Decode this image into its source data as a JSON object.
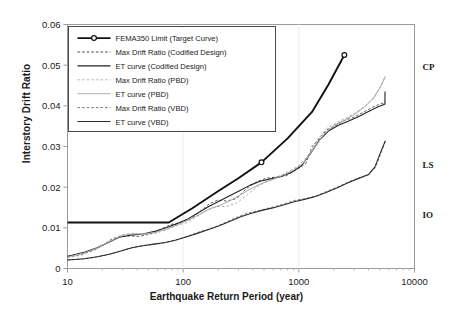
{
  "chart_data": {
    "type": "line",
    "title": "",
    "xlabel": "Earthquake Return Period (year)",
    "ylabel": "Interstory Drift Ratio",
    "xscale": "log",
    "xlim": [
      10,
      10000
    ],
    "ylim": [
      0,
      0.06
    ],
    "xticks": [
      10,
      100,
      1000,
      10000
    ],
    "xtick_labels": [
      "10",
      "100",
      "1000",
      "10000"
    ],
    "yticks": [
      0,
      0.01,
      0.02,
      0.03,
      0.04,
      0.05,
      0.06
    ],
    "ytick_labels": [
      "0",
      "0.01",
      "0.02",
      "0.03",
      "0.04",
      "0.05",
      "0.06"
    ],
    "grid": false,
    "legend_position": "upper left",
    "annotations": [
      {
        "label": "CP",
        "value": 0.0495,
        "note": "Collapse Prevention performance level"
      },
      {
        "label": "LS",
        "value": 0.0255,
        "note": "Life Safety performance level"
      },
      {
        "label": "IO",
        "value": 0.0133,
        "note": "Immediate Occupancy performance level"
      }
    ],
    "series": [
      {
        "name": "FEMA350 Limit (Target Curve)",
        "style": "solid",
        "color": "#111111",
        "width": 1.9,
        "marker": "circle-open",
        "markers_at": [
          [
            475,
            0.0261
          ],
          [
            2475,
            0.0525
          ]
        ],
        "points": [
          [
            10,
            0.0113
          ],
          [
            30,
            0.0113
          ],
          [
            50,
            0.0113
          ],
          [
            75,
            0.0113
          ],
          [
            120,
            0.0148
          ],
          [
            200,
            0.019
          ],
          [
            300,
            0.0222
          ],
          [
            475,
            0.0261
          ],
          [
            800,
            0.032
          ],
          [
            1300,
            0.0385
          ],
          [
            1800,
            0.0452
          ],
          [
            2475,
            0.0525
          ]
        ]
      },
      {
        "name": "Max Drift Ratio (Codified Design)",
        "style": "dashed",
        "color": "#333333",
        "width": 0.8,
        "points": [
          [
            10,
            0.0029
          ],
          [
            13,
            0.0034
          ],
          [
            17,
            0.0045
          ],
          [
            20,
            0.0056
          ],
          [
            24,
            0.0072
          ],
          [
            28,
            0.0078
          ],
          [
            34,
            0.008
          ],
          [
            42,
            0.0079
          ],
          [
            52,
            0.0085
          ],
          [
            64,
            0.0096
          ],
          [
            78,
            0.0108
          ],
          [
            95,
            0.0113
          ],
          [
            115,
            0.0122
          ],
          [
            140,
            0.014
          ],
          [
            170,
            0.016
          ],
          [
            200,
            0.0168
          ],
          [
            240,
            0.0166
          ],
          [
            290,
            0.0172
          ],
          [
            350,
            0.0196
          ],
          [
            430,
            0.0213
          ],
          [
            520,
            0.0222
          ],
          [
            640,
            0.0225
          ],
          [
            780,
            0.0228
          ],
          [
            950,
            0.0243
          ],
          [
            1150,
            0.0258
          ],
          [
            1300,
            0.03
          ],
          [
            1500,
            0.032
          ],
          [
            1750,
            0.0341
          ],
          [
            2100,
            0.0352
          ],
          [
            2500,
            0.0364
          ],
          [
            3000,
            0.0372
          ],
          [
            3600,
            0.0384
          ],
          [
            4300,
            0.0396
          ],
          [
            5200,
            0.0406
          ],
          [
            5600,
            0.0406
          ]
        ]
      },
      {
        "name": "ET curve (Codified Design)",
        "style": "solid",
        "color": "#222222",
        "width": 1.1,
        "points": [
          [
            10,
            0.003
          ],
          [
            14,
            0.004
          ],
          [
            18,
            0.0051
          ],
          [
            23,
            0.0065
          ],
          [
            28,
            0.0077
          ],
          [
            35,
            0.0082
          ],
          [
            45,
            0.0085
          ],
          [
            58,
            0.0092
          ],
          [
            72,
            0.0101
          ],
          [
            90,
            0.0111
          ],
          [
            110,
            0.0122
          ],
          [
            135,
            0.0137
          ],
          [
            165,
            0.0152
          ],
          [
            200,
            0.0164
          ],
          [
            250,
            0.0178
          ],
          [
            310,
            0.0192
          ],
          [
            380,
            0.0205
          ],
          [
            470,
            0.0215
          ],
          [
            580,
            0.0221
          ],
          [
            700,
            0.0226
          ],
          [
            860,
            0.0236
          ],
          [
            1050,
            0.0252
          ],
          [
            1250,
            0.0281
          ],
          [
            1500,
            0.0315
          ],
          [
            1800,
            0.0338
          ],
          [
            2200,
            0.0352
          ],
          [
            2700,
            0.0363
          ],
          [
            3300,
            0.0374
          ],
          [
            4000,
            0.0386
          ],
          [
            4800,
            0.0397
          ],
          [
            5500,
            0.0404
          ],
          [
            5550,
            0.0404
          ],
          [
            5560,
            0.0435
          ]
        ]
      },
      {
        "name": "Max Drift Ratio (PBD)",
        "style": "dashed",
        "color": "#9a9a9a",
        "width": 0.8,
        "points": [
          [
            10,
            0.0027
          ],
          [
            13,
            0.0032
          ],
          [
            16,
            0.0043
          ],
          [
            20,
            0.0057
          ],
          [
            25,
            0.0074
          ],
          [
            30,
            0.0083
          ],
          [
            37,
            0.0086
          ],
          [
            46,
            0.0083
          ],
          [
            57,
            0.0086
          ],
          [
            70,
            0.0094
          ],
          [
            86,
            0.0105
          ],
          [
            105,
            0.0112
          ],
          [
            130,
            0.0127
          ],
          [
            160,
            0.0143
          ],
          [
            195,
            0.0152
          ],
          [
            240,
            0.0153
          ],
          [
            295,
            0.0162
          ],
          [
            360,
            0.0182
          ],
          [
            440,
            0.0202
          ],
          [
            540,
            0.0216
          ],
          [
            660,
            0.0226
          ],
          [
            810,
            0.0238
          ],
          [
            990,
            0.0252
          ],
          [
            1200,
            0.0278
          ],
          [
            1450,
            0.0316
          ],
          [
            1750,
            0.0345
          ],
          [
            2100,
            0.0358
          ],
          [
            2550,
            0.037
          ],
          [
            3100,
            0.0383
          ],
          [
            3750,
            0.04
          ],
          [
            4500,
            0.042
          ],
          [
            5200,
            0.0452
          ],
          [
            5600,
            0.0473
          ]
        ]
      },
      {
        "name": "ET curve (PBD)",
        "style": "solid",
        "color": "#a8a8a8",
        "width": 1.0,
        "points": [
          [
            10,
            0.0028
          ],
          [
            14,
            0.0038
          ],
          [
            18,
            0.005
          ],
          [
            23,
            0.0066
          ],
          [
            29,
            0.008
          ],
          [
            36,
            0.0085
          ],
          [
            46,
            0.0085
          ],
          [
            58,
            0.0089
          ],
          [
            72,
            0.0097
          ],
          [
            90,
            0.0108
          ],
          [
            112,
            0.012
          ],
          [
            138,
            0.0133
          ],
          [
            170,
            0.0147
          ],
          [
            210,
            0.0156
          ],
          [
            260,
            0.0168
          ],
          [
            320,
            0.0183
          ],
          [
            395,
            0.0198
          ],
          [
            485,
            0.021
          ],
          [
            600,
            0.0219
          ],
          [
            735,
            0.023
          ],
          [
            900,
            0.0242
          ],
          [
            1100,
            0.026
          ],
          [
            1350,
            0.0295
          ],
          [
            1650,
            0.033
          ],
          [
            2000,
            0.0352
          ],
          [
            2450,
            0.0364
          ],
          [
            3000,
            0.0378
          ],
          [
            3650,
            0.0396
          ],
          [
            4400,
            0.0418
          ],
          [
            5100,
            0.0448
          ],
          [
            5600,
            0.0473
          ]
        ]
      },
      {
        "name": "Max Drift Ratio (VBD)",
        "style": "dashed",
        "color": "#555555",
        "width": 0.8,
        "points": [
          [
            10,
            0.0021
          ],
          [
            13,
            0.0023
          ],
          [
            17,
            0.0027
          ],
          [
            21,
            0.0032
          ],
          [
            26,
            0.0039
          ],
          [
            32,
            0.0047
          ],
          [
            40,
            0.0054
          ],
          [
            50,
            0.0058
          ],
          [
            62,
            0.0061
          ],
          [
            77,
            0.0066
          ],
          [
            95,
            0.0074
          ],
          [
            118,
            0.0083
          ],
          [
            145,
            0.0092
          ],
          [
            180,
            0.01
          ],
          [
            220,
            0.011
          ],
          [
            270,
            0.0122
          ],
          [
            335,
            0.0133
          ],
          [
            410,
            0.014
          ],
          [
            505,
            0.0146
          ],
          [
            620,
            0.0152
          ],
          [
            765,
            0.016
          ],
          [
            940,
            0.0168
          ],
          [
            1150,
            0.0172
          ],
          [
            1420,
            0.0179
          ],
          [
            1750,
            0.019
          ],
          [
            2150,
            0.02
          ],
          [
            2650,
            0.0212
          ],
          [
            3250,
            0.0222
          ],
          [
            4000,
            0.023
          ],
          [
            4600,
            0.0248
          ],
          [
            5100,
            0.0282
          ],
          [
            5600,
            0.0314
          ]
        ]
      },
      {
        "name": "ET curve (VBD)",
        "style": "solid",
        "color": "#2b2b2b",
        "width": 1.1,
        "points": [
          [
            10,
            0.0021
          ],
          [
            14,
            0.0024
          ],
          [
            18,
            0.0029
          ],
          [
            23,
            0.0035
          ],
          [
            29,
            0.0043
          ],
          [
            36,
            0.0051
          ],
          [
            45,
            0.0056
          ],
          [
            56,
            0.006
          ],
          [
            70,
            0.0064
          ],
          [
            87,
            0.007
          ],
          [
            108,
            0.0078
          ],
          [
            134,
            0.0087
          ],
          [
            166,
            0.0096
          ],
          [
            205,
            0.0105
          ],
          [
            255,
            0.0116
          ],
          [
            315,
            0.0127
          ],
          [
            390,
            0.0136
          ],
          [
            480,
            0.0143
          ],
          [
            595,
            0.0149
          ],
          [
            735,
            0.0156
          ],
          [
            910,
            0.0164
          ],
          [
            1120,
            0.017
          ],
          [
            1390,
            0.0177
          ],
          [
            1720,
            0.0187
          ],
          [
            2130,
            0.0198
          ],
          [
            2630,
            0.021
          ],
          [
            3250,
            0.0221
          ],
          [
            4000,
            0.0231
          ],
          [
            4550,
            0.025
          ],
          [
            5050,
            0.0283
          ],
          [
            5600,
            0.0314
          ]
        ]
      }
    ]
  },
  "legend": {
    "items": [
      {
        "label": "FEMA350 Limit (Target Curve)",
        "style": "solid-marker",
        "color": "#111111",
        "width": 1.9
      },
      {
        "label": "Max Drift Ratio (Codified Design)",
        "style": "dashed",
        "color": "#333333",
        "width": 0.9
      },
      {
        "label": "ET curve (Codified Design)",
        "style": "solid",
        "color": "#222222",
        "width": 1.3
      },
      {
        "label": "Max Drift Ratio (PBD)",
        "style": "dashed",
        "color": "#b0b0b0",
        "width": 0.9
      },
      {
        "label": "ET curve (PBD)",
        "style": "solid",
        "color": "#b0b0b0",
        "width": 1.0
      },
      {
        "label": "Max Drift Ratio (VBD)",
        "style": "dashed",
        "color": "#666666",
        "width": 0.9
      },
      {
        "label": "ET curve (VBD)",
        "style": "solid",
        "color": "#2b2b2b",
        "width": 1.2
      }
    ]
  },
  "axes": {
    "frame_color": "#9b9b9b",
    "text_color": "#1a1a1a"
  }
}
